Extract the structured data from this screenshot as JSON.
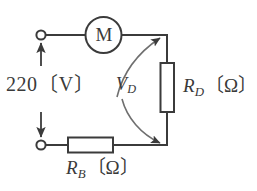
{
  "diagram": {
    "stroke_color": "#3b3b3b",
    "fill_color": "#ffffff",
    "background": "#ffffff"
  },
  "labels": {
    "supply_voltage": "220〔V〕",
    "supply_value": "220",
    "supply_unit": "〔V〕",
    "motor": "M",
    "resistor_d_symbol": "R",
    "resistor_d_subscript": "D",
    "resistor_d_unit": "〔Ω〕",
    "resistor_b_symbol": "R",
    "resistor_b_subscript": "B",
    "resistor_b_unit": "〔Ω〕",
    "voltage_d_symbol": "V",
    "voltage_d_subscript": "D"
  },
  "components": {
    "terminal_top": "open-terminal",
    "terminal_bottom": "open-terminal",
    "motor": "motor-circle",
    "resistor_d": "resistor-box-vertical",
    "resistor_b": "resistor-box-horizontal",
    "supply_dimension_arrow": "double-headed-arrow",
    "vd_arrow_upper": "curved-arrow-up",
    "vd_arrow_lower": "curved-arrow-down"
  }
}
